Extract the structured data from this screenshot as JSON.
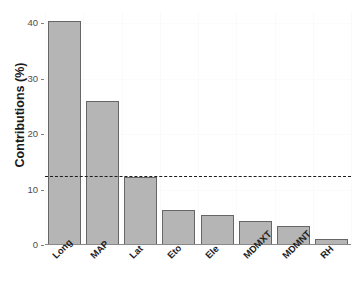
{
  "chart_data": {
    "type": "bar",
    "title": "",
    "subtitle": "",
    "xlabel": "",
    "ylabel": "Contributions (%)",
    "categories": [
      "Long",
      "MAP",
      "Lat",
      "Eto",
      "Ele",
      "MDMXT",
      "MDMNT",
      "RH"
    ],
    "values": [
      40.3,
      26.0,
      12.3,
      6.3,
      5.5,
      4.3,
      3.5,
      1.1
    ],
    "ylim": [
      0,
      42
    ],
    "yticks": [
      0,
      10,
      20,
      30,
      40
    ],
    "ytick_labels": [
      "0",
      "10",
      "20",
      "30",
      "40"
    ],
    "grid": "faint",
    "legend": "none",
    "annotations": [
      {
        "name": "mean-contribution-reference-line",
        "type": "horizontal-dashed-line",
        "value": 12.5,
        "style": "dashed",
        "color": "#1c1c1c"
      }
    ],
    "bar_style": {
      "fill": "#b5b5b5",
      "border": "#666666"
    }
  },
  "axis": {
    "y_title": "Contributions (%)"
  }
}
